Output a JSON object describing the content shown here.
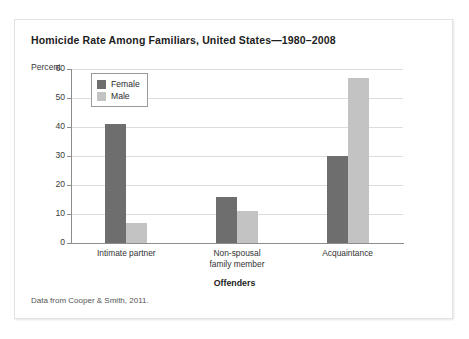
{
  "figure": {
    "title": "Homicide Rate Among Familiars, United States—1980–2008",
    "unit_label": "Percent",
    "source_note": "Data from Cooper & Smith, 2011."
  },
  "colors": {
    "female_bar": "#6e6e6e",
    "male_bar": "#c3c3c3",
    "gridline": "#dcdcdc",
    "axis": "#8c8c8c",
    "card_background": "#ffffff",
    "card_border": "#e2e2e2"
  },
  "chart_data": {
    "type": "bar",
    "title": "Homicide Rate Among Familiars, United States—1980–2008",
    "subtitle": "",
    "categories": [
      "Intimate partner",
      "Non-spousal family member",
      "Acquaintance"
    ],
    "category_lines": [
      [
        "Intimate partner"
      ],
      [
        "Non-spousal",
        "family member"
      ],
      [
        "Acquaintance"
      ]
    ],
    "series": [
      {
        "name": "Female",
        "color": "#6e6e6e",
        "values": [
          41,
          16,
          30
        ]
      },
      {
        "name": "Male",
        "color": "#c3c3c3",
        "values": [
          7,
          11,
          57
        ]
      }
    ],
    "xlabel": "Offenders",
    "ylabel": "Percent",
    "ylim": [
      0,
      60
    ],
    "yticks": [
      0,
      10,
      20,
      30,
      40,
      50,
      60
    ],
    "ytick_labels": [
      "0",
      "10",
      "20",
      "30",
      "40",
      "50",
      "60"
    ],
    "grid": true,
    "legend_position": "top-left-inside",
    "annotations": [
      "Data from Cooper & Smith, 2011."
    ]
  },
  "legend": {
    "items": [
      {
        "label": "Female"
      },
      {
        "label": "Male"
      }
    ]
  }
}
